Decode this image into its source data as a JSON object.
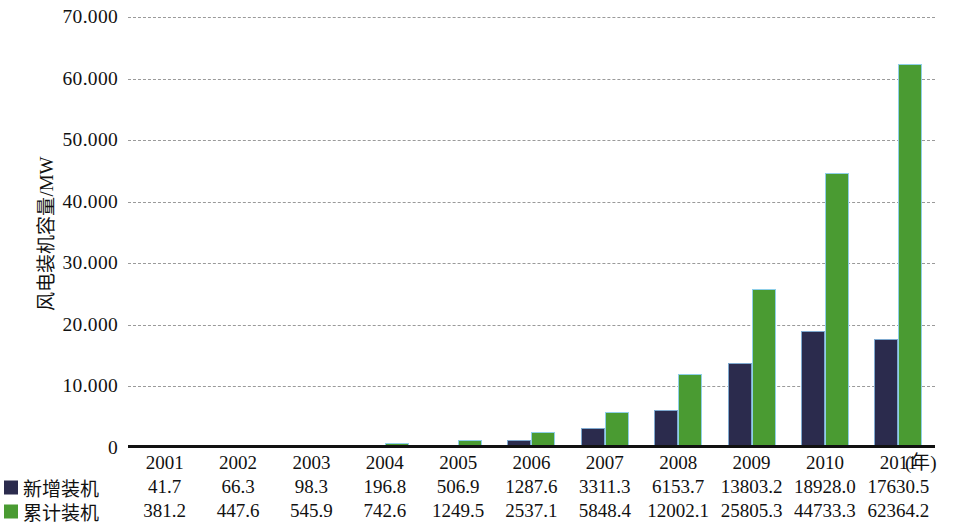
{
  "chart_data": {
    "type": "bar",
    "title": "",
    "xlabel": "(年)",
    "ylabel": "风电装机容量/MW",
    "categories": [
      "2001",
      "2002",
      "2003",
      "2004",
      "2005",
      "2006",
      "2007",
      "2008",
      "2009",
      "2010",
      "2011"
    ],
    "series": [
      {
        "name": "新增装机",
        "color": "#2b2b4d",
        "values": [
          41.7,
          66.3,
          98.3,
          196.8,
          506.9,
          1287.6,
          3311.3,
          6153.7,
          13803.2,
          18928.0,
          17630.5
        ],
        "labels": [
          "41.7",
          "66.3",
          "98.3",
          "196.8",
          "506.9",
          "1287.6",
          "3311.3",
          "6153.7",
          "13803.2",
          "18928.0",
          "17630.5"
        ]
      },
      {
        "name": "累计装机",
        "color": "#4a9b32",
        "values": [
          381.2,
          447.6,
          545.9,
          742.6,
          1249.5,
          2537.1,
          5848.4,
          12002.1,
          25805.3,
          44733.3,
          62364.2
        ],
        "labels": [
          "381.2",
          "447.6",
          "545.9",
          "742.6",
          "1249.5",
          "2537.1",
          "5848.4",
          "12002.1",
          "25805.3",
          "44733.3",
          "62364.2"
        ]
      }
    ],
    "ylim": [
      0,
      70000
    ],
    "yticks": [
      0,
      10000,
      20000,
      30000,
      40000,
      50000,
      60000,
      70000
    ],
    "ytick_labels": [
      "0",
      "10.000",
      "20.000",
      "30.000",
      "40.000",
      "50.000",
      "60.000",
      "70.000"
    ],
    "grid": "horizontal-dashed",
    "legend_position": "bottom-left-table",
    "gridline_color": "#9a9a9a",
    "axis_color": "#111111",
    "background": "#ffffff"
  },
  "axis": {
    "y_title": "风电装机容量/MW",
    "x_unit": "(年)"
  },
  "legend": {
    "new_label": "新增装机",
    "cumulative_label": "累计装机"
  }
}
